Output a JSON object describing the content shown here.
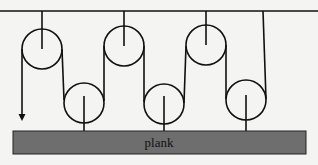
{
  "diagram": {
    "type": "pulley-system",
    "plank_label": "plank",
    "colors": {
      "line": "#111111",
      "plank": "#6e6e6e",
      "background": "#f4f4f2"
    },
    "top_pulleys": 3,
    "bottom_pulleys": 3
  }
}
